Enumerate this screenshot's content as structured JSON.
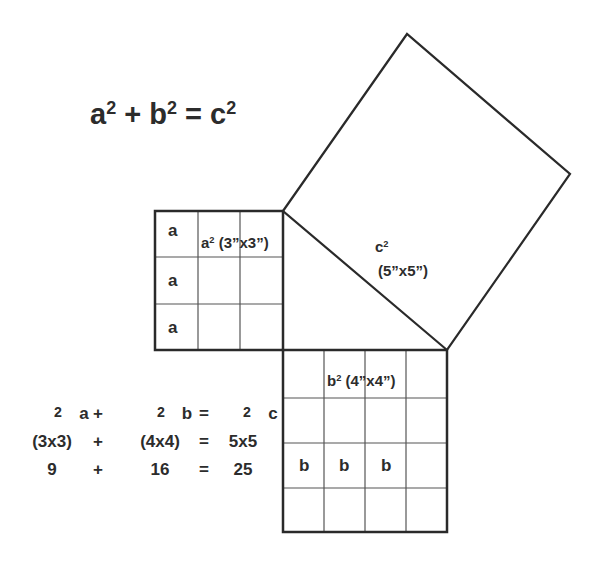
{
  "title": {
    "a": "a",
    "exp": "2",
    "plus": "+ ",
    "b": "b",
    "eq": "= ",
    "c": "c"
  },
  "a_square": {
    "label_base": "a",
    "label_exp": "2",
    "label_dims": " (3”x3”)",
    "side_labels": [
      "a",
      "a",
      "a"
    ],
    "grid": 3
  },
  "b_square": {
    "label_base": "b",
    "label_exp": "2",
    "label_dims": " (4”x4”)",
    "side_labels": [
      "b",
      "b",
      "b"
    ],
    "grid": 4
  },
  "c_square": {
    "label_base": "c",
    "label_exp": "2",
    "label_dims": "(5”x5”)"
  },
  "equations": {
    "row1": [
      "a",
      "+",
      "b",
      "=",
      "c"
    ],
    "row1_exp": "2",
    "row2": [
      "(3x3)",
      "+",
      "(4x4)",
      "=",
      "5x5"
    ],
    "row3": [
      "9",
      "+",
      "16",
      "=",
      "25"
    ]
  },
  "colors": {
    "line": "#2a2a2a",
    "grid": "#555555",
    "background": "#ffffff"
  }
}
